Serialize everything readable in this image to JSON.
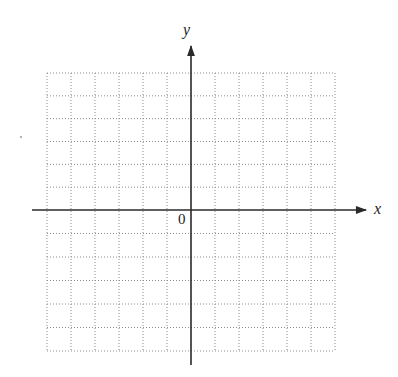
{
  "diagram": {
    "type": "cartesian-coordinate-grid",
    "x_axis_label": "x",
    "y_axis_label": "y",
    "origin_label": "0",
    "grid": {
      "columns": 12,
      "rows": 12,
      "columns_left_of_y_axis": 6,
      "columns_right_of_y_axis": 6,
      "rows_above_x_axis": 6,
      "rows_below_x_axis": 6,
      "line_style": "dotted",
      "line_color": "#8c8c8c"
    },
    "axis_color": "#2a2a2a",
    "label_color": "#222222"
  }
}
